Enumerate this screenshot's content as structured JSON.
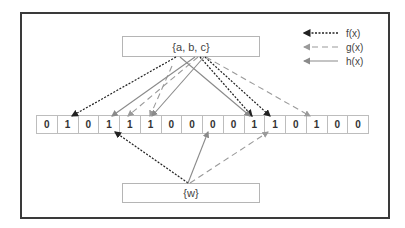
{
  "diagram": {
    "type": "bloom-filter",
    "input_set_label": "{a, b, c}",
    "query_label": "{w}",
    "bits": [
      "0",
      "1",
      "0",
      "1",
      "1",
      "1",
      "0",
      "0",
      "0",
      "0",
      "1",
      "1",
      "0",
      "1",
      "0",
      "0"
    ],
    "legend": [
      {
        "label": "f(x)",
        "style": "dotted",
        "color": "#222222"
      },
      {
        "label": "g(x)",
        "style": "dashed",
        "color": "#9a9a9a"
      },
      {
        "label": "h(x)",
        "style": "solid",
        "color": "#8a8a8a"
      }
    ],
    "colors": {
      "frame": "#3a3a3a",
      "box_border": "#b5b5b5",
      "f": "#222222",
      "g": "#9a9a9a",
      "h": "#8a8a8a"
    },
    "mappings_from_set": [
      {
        "fn": "f(x)",
        "targets": [
          1,
          10,
          11
        ]
      },
      {
        "fn": "g(x)",
        "targets": [
          4,
          5,
          13
        ]
      },
      {
        "fn": "h(x)",
        "targets": [
          3,
          5,
          10
        ]
      }
    ],
    "mappings_from_query": [
      {
        "fn": "f(x)",
        "target": 3
      },
      {
        "fn": "h(x)",
        "target": 8
      },
      {
        "fn": "g(x)",
        "target": 11
      }
    ]
  }
}
